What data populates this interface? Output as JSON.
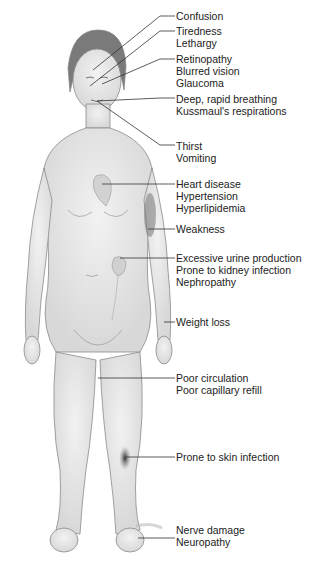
{
  "diagram": {
    "labels": [
      {
        "id": "confusion",
        "top": 10,
        "lines": [
          "Confusion"
        ]
      },
      {
        "id": "tiredness",
        "top": 25,
        "lines": [
          "Tiredness",
          "Lethargy"
        ]
      },
      {
        "id": "eyes",
        "top": 53,
        "lines": [
          "Retinopathy",
          "Blurred vision",
          "Glaucoma"
        ]
      },
      {
        "id": "breathing",
        "top": 95,
        "lines": [
          "Deep, rapid breathing",
          "Kussmaul's respirations"
        ]
      },
      {
        "id": "thirst",
        "top": 141,
        "lines": [
          "Thirst",
          "Vomiting"
        ]
      },
      {
        "id": "heart",
        "top": 178,
        "lines": [
          "Heart disease",
          "Hypertension",
          "Hyperlipidemia"
        ]
      },
      {
        "id": "weakness",
        "top": 223,
        "lines": [
          "Weakness"
        ]
      },
      {
        "id": "kidney",
        "top": 250,
        "lines": [
          "Excessive urine production",
          "Prone to kidney infection",
          "Nephropathy"
        ]
      },
      {
        "id": "weight",
        "top": 316,
        "lines": [
          "Weight loss"
        ]
      },
      {
        "id": "circulation",
        "top": 371,
        "lines": [
          "Poor circulation",
          "Poor capillary refill"
        ]
      },
      {
        "id": "skin",
        "top": 451,
        "lines": [
          "Prone to skin infection"
        ]
      },
      {
        "id": "nerve",
        "top": 524,
        "lines": [
          "Nerve damage",
          "Neuropathy"
        ]
      }
    ]
  }
}
